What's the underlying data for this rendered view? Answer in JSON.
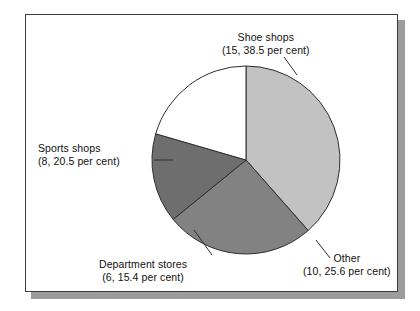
{
  "figure": {
    "background_color": "#ffffff",
    "frame_border_color": "#3b3b3b",
    "shadow_color": "#9c9c9c"
  },
  "chart_data": {
    "type": "pie",
    "title": "",
    "xlabel": "",
    "ylabel": "",
    "legend_position": "callout-labels",
    "grid": false,
    "total_count": 39,
    "units": "per cent",
    "categories": [
      "Shoe shops",
      "Other",
      "Department stores",
      "Sports shops"
    ],
    "values": [
      38.5,
      25.6,
      15.4,
      20.5
    ],
    "counts": [
      15,
      10,
      6,
      8
    ],
    "colors": [
      "#c2c2c2",
      "#828282",
      "#6e6e6e",
      "#ffffff"
    ],
    "start_angle_deg": 0,
    "direction": "clockwise",
    "slices": [
      {
        "name": "Shoe shops",
        "label_line1": "Shoe shops",
        "label_line2": "(15, 38.5 per cent)",
        "count": 15,
        "percent": 38.5,
        "color": "#c2c2c2",
        "start_deg": 0,
        "end_deg": 138.6
      },
      {
        "name": "Other",
        "label_line1": "Other",
        "label_line2": "(10, 25.6 per cent)",
        "count": 10,
        "percent": 25.6,
        "color": "#828282",
        "start_deg": 138.6,
        "end_deg": 230.8
      },
      {
        "name": "Department stores",
        "label_line1": "Department stores",
        "label_line2": "(6, 15.4 per cent)",
        "count": 6,
        "percent": 15.4,
        "color": "#6e6e6e",
        "start_deg": 230.8,
        "end_deg": 286.2
      },
      {
        "name": "Sports shops",
        "label_line1": "Sports shops",
        "label_line2": "(8, 20.5 per cent)",
        "count": 8,
        "percent": 20.5,
        "color": "#ffffff",
        "start_deg": 286.2,
        "end_deg": 360
      }
    ]
  }
}
